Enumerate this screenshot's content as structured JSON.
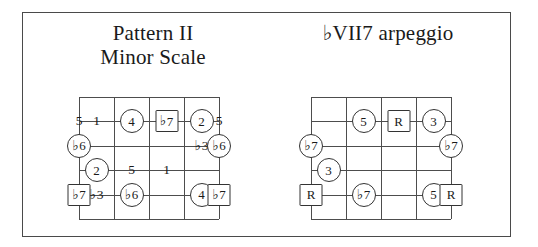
{
  "page": {
    "background_color": "#ffffff",
    "border_color": "#4a4a4a",
    "grid_color": "#4d4d4d",
    "marker_outline_color": "#333333"
  },
  "diagrams": [
    {
      "id": "pattern-2-minor-scale",
      "title_line1": "Pattern II",
      "title_line2": "Minor Scale",
      "grid": {
        "strings": 6,
        "frets": 5,
        "marker_columns": 6
      },
      "markers": [
        {
          "row": 2,
          "col": 1,
          "shape": "plain",
          "accidental": "",
          "text": "5"
        },
        {
          "row": 2,
          "col": 2,
          "shape": "plain",
          "accidental": "",
          "text": "1"
        },
        {
          "row": 2,
          "col": 3,
          "shape": "circle",
          "accidental": "",
          "text": "4"
        },
        {
          "row": 2,
          "col": 4,
          "shape": "box",
          "accidental": "♭",
          "text": "7"
        },
        {
          "row": 2,
          "col": 5,
          "shape": "circle",
          "accidental": "",
          "text": "2"
        },
        {
          "row": 2,
          "col": 6,
          "shape": "plain",
          "accidental": "",
          "text": "5"
        },
        {
          "row": 3,
          "col": 1,
          "shape": "circle",
          "accidental": "♭",
          "text": "6"
        },
        {
          "row": 3,
          "col": 5,
          "shape": "plain",
          "accidental": "♭",
          "text": "3"
        },
        {
          "row": 3,
          "col": 6,
          "shape": "circle",
          "accidental": "♭",
          "text": "6"
        },
        {
          "row": 4,
          "col": 2,
          "shape": "circle",
          "accidental": "",
          "text": "2"
        },
        {
          "row": 4,
          "col": 3,
          "shape": "plain",
          "accidental": "",
          "text": "5"
        },
        {
          "row": 4,
          "col": 4,
          "shape": "plain",
          "accidental": "",
          "text": "1"
        },
        {
          "row": 5,
          "col": 1,
          "shape": "box",
          "accidental": "♭",
          "text": "7"
        },
        {
          "row": 5,
          "col": 2,
          "shape": "plain",
          "accidental": "♭",
          "text": "3"
        },
        {
          "row": 5,
          "col": 3,
          "shape": "circle",
          "accidental": "♭",
          "text": "6"
        },
        {
          "row": 5,
          "col": 5,
          "shape": "circle",
          "accidental": "",
          "text": "4"
        },
        {
          "row": 5,
          "col": 6,
          "shape": "box",
          "accidental": "♭",
          "text": "7"
        }
      ]
    },
    {
      "id": "flat-vii7-arpeggio",
      "title_line1": "♭VII7 arpeggio",
      "title_line2": "",
      "grid": {
        "strings": 6,
        "frets": 5,
        "marker_columns": 6
      },
      "markers": [
        {
          "row": 2,
          "col": 3,
          "shape": "circle",
          "accidental": "",
          "text": "5"
        },
        {
          "row": 2,
          "col": 4,
          "shape": "box",
          "accidental": "",
          "text": "R"
        },
        {
          "row": 2,
          "col": 5,
          "shape": "circle",
          "accidental": "",
          "text": "3"
        },
        {
          "row": 3,
          "col": 1,
          "shape": "circle",
          "accidental": "♭",
          "text": "7"
        },
        {
          "row": 3,
          "col": 6,
          "shape": "circle",
          "accidental": "♭",
          "text": "7"
        },
        {
          "row": 4,
          "col": 2,
          "shape": "circle",
          "accidental": "",
          "text": "3"
        },
        {
          "row": 5,
          "col": 1,
          "shape": "box",
          "accidental": "",
          "text": "R"
        },
        {
          "row": 5,
          "col": 3,
          "shape": "circle",
          "accidental": "♭",
          "text": "7"
        },
        {
          "row": 5,
          "col": 5,
          "shape": "circle",
          "accidental": "",
          "text": "5"
        },
        {
          "row": 5,
          "col": 6,
          "shape": "box",
          "accidental": "",
          "text": "R"
        }
      ]
    }
  ]
}
